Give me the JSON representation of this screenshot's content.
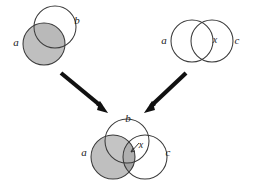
{
  "figure": {
    "kind": "venn-diagram-composition",
    "background_color": "#ffffff",
    "stroke_color": "#3a3a3a",
    "shade_light": "#bfbfbf",
    "shade_dark": "#a0a0a0",
    "shade_darker": "#8c8c8c",
    "arrow_color": "#111111"
  },
  "panels": [
    {
      "id": "top-left",
      "name": "venn-ab",
      "sets": [
        "a",
        "b"
      ],
      "labels": [
        {
          "text": "a",
          "role": "set-label",
          "set": "a",
          "x": 16,
          "y": 43
        },
        {
          "text": "b",
          "role": "set-label",
          "set": "b",
          "x": 77,
          "y": 21
        }
      ],
      "circles": [
        {
          "set": "b",
          "cx": 55,
          "cy": 27,
          "r": 21,
          "fill": "none"
        },
        {
          "set": "a",
          "cx": 44,
          "cy": 44,
          "r": 21,
          "fill": "#bfbfbf"
        }
      ],
      "shaded_regions": [
        "a"
      ]
    },
    {
      "id": "top-right",
      "name": "venn-ac",
      "sets": [
        "a",
        "c"
      ],
      "labels": [
        {
          "text": "a",
          "role": "set-label",
          "set": "a",
          "x": 164,
          "y": 41
        },
        {
          "text": "x",
          "role": "element-label",
          "x": 215,
          "y": 41
        },
        {
          "text": "c",
          "role": "set-label",
          "set": "c",
          "x": 237,
          "y": 41
        }
      ],
      "circles": [
        {
          "set": "a",
          "cx": 192,
          "cy": 41,
          "r": 21,
          "fill": "none"
        },
        {
          "set": "c",
          "cx": 212,
          "cy": 41,
          "r": 21,
          "fill": "none"
        }
      ],
      "shaded_regions": []
    },
    {
      "id": "bottom",
      "name": "venn-abc",
      "sets": [
        "a",
        "b",
        "c"
      ],
      "labels": [
        {
          "text": "b",
          "role": "set-label",
          "set": "b",
          "x": 128,
          "y": 119
        },
        {
          "text": "a",
          "role": "set-label",
          "set": "a",
          "x": 84,
          "y": 153
        },
        {
          "text": "x",
          "role": "element-label",
          "x": 141,
          "y": 146
        },
        {
          "text": "c",
          "role": "set-label",
          "set": "c",
          "x": 168,
          "y": 153
        }
      ],
      "circles": [
        {
          "set": "b",
          "cx": 127,
          "cy": 141,
          "r": 22,
          "fill": "none"
        },
        {
          "set": "a",
          "cx": 113,
          "cy": 157,
          "r": 22,
          "fill": "#bfbfbf"
        },
        {
          "set": "c",
          "cx": 145,
          "cy": 157,
          "r": 22,
          "fill": "none"
        }
      ],
      "shaded_regions": [
        "a"
      ]
    }
  ],
  "arrows": [
    {
      "name": "arrow-left",
      "from_panel": "top-left",
      "to_panel": "bottom",
      "x1": 61,
      "y1": 73,
      "x2": 106,
      "y2": 110,
      "direction": "down-right"
    },
    {
      "name": "arrow-right",
      "from_panel": "top-right",
      "to_panel": "bottom",
      "x1": 186,
      "y1": 73,
      "x2": 146,
      "y2": 110,
      "direction": "down-left"
    }
  ],
  "pointer": {
    "name": "x-pointer",
    "panel": "bottom",
    "x1": 139,
    "y1": 143,
    "x2": 131,
    "y2": 152
  }
}
